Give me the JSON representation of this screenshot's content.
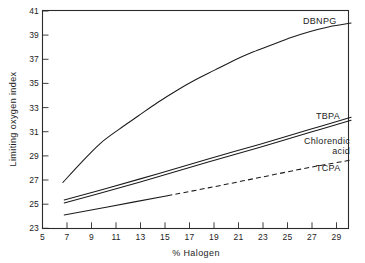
{
  "chart_data": {
    "type": "line",
    "title": "",
    "xlabel": "% Halogen",
    "ylabel": "Limiting oxygen index",
    "xlim": [
      5,
      29
    ],
    "ylim": [
      23,
      41
    ],
    "grid": false,
    "legend_position": "inline-right-end-labels",
    "xticks": [
      5,
      7,
      9,
      11,
      13,
      15,
      17,
      19,
      21,
      23,
      25,
      27,
      29
    ],
    "xtick_labels": [
      "5",
      "7",
      "9",
      "11",
      "13",
      "15",
      "17",
      "19",
      "21",
      "23",
      "25",
      "27",
      "29"
    ],
    "yticks": [
      23,
      25,
      27,
      29,
      31,
      33,
      35,
      37,
      39,
      41
    ],
    "ytick_labels": [
      "23",
      "25",
      "27",
      "29",
      "31",
      "33",
      "35",
      "37",
      "39",
      "41"
    ],
    "series": [
      {
        "name": "DBNPG",
        "label": "DBNPG",
        "style": "solid",
        "x": [
          6.6,
          8.0,
          9.5,
          11.0,
          12.5,
          14.0,
          15.5,
          17.0,
          18.5,
          20.0,
          21.5,
          23.0,
          24.5,
          26.0,
          27.5,
          29.2
        ],
        "y": [
          26.8,
          28.4,
          30.0,
          31.2,
          32.3,
          33.4,
          34.4,
          35.3,
          36.1,
          36.9,
          37.6,
          38.2,
          38.8,
          39.3,
          39.7,
          40.0
        ]
      },
      {
        "name": "TBPA",
        "label": "TBPA",
        "style": "solid",
        "x": [
          6.7,
          10.0,
          14.0,
          18.0,
          22.0,
          26.0,
          29.2
        ],
        "y": [
          25.35,
          26.3,
          27.5,
          28.75,
          29.95,
          31.2,
          32.2
        ]
      },
      {
        "name": "Chlorendic acid",
        "label": "Chlorendic acid",
        "style": "solid",
        "x": [
          6.7,
          10.0,
          14.0,
          18.0,
          22.0,
          26.0,
          29.2
        ],
        "y": [
          25.1,
          26.05,
          27.25,
          28.5,
          29.7,
          30.95,
          31.95
        ]
      },
      {
        "name": "TCPA",
        "label": "TCPA",
        "style": "solid-then-dashed",
        "dash_start_x": 14.8,
        "x": [
          6.7,
          10.0,
          14.8,
          18.0,
          22.0,
          26.0,
          29.2
        ],
        "y": [
          24.1,
          24.75,
          25.7,
          26.35,
          27.2,
          28.05,
          28.65
        ]
      }
    ]
  },
  "axes": {
    "x_title": "% Halogen",
    "y_title": "Limiting oxygen index"
  },
  "labels": {
    "dbnpg": "DBNPG",
    "tbpa": "TBPA",
    "chlorendic_line1": "Chlorendic",
    "chlorendic_line2": "acid",
    "tcpa": "TCPA"
  }
}
